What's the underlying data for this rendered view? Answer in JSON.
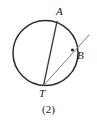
{
  "figure": {
    "caption": "(2)",
    "background_color": "#ffffff",
    "stroke_color": "#2b2b2b",
    "secant_color": "#6e6e6e",
    "labels": {
      "a": "A",
      "b": "B",
      "t": "T"
    },
    "geometry": {
      "circle": {
        "cx": 45.5,
        "cy": 53,
        "r": 32.5
      },
      "point_a": {
        "x": 57,
        "y": 21.5
      },
      "point_b": {
        "x": 72.5,
        "y": 50
      },
      "point_t": {
        "x": 43.5,
        "y": 85.5
      },
      "secant_end": {
        "x": 89,
        "y": 35
      }
    }
  }
}
